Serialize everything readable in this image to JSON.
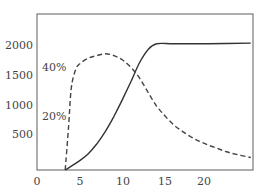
{
  "chart_data": {
    "type": "line",
    "title": "",
    "xlabel": "",
    "ylabel": "",
    "xlim": [
      0,
      25
    ],
    "ylim": [
      0,
      2300
    ],
    "grid": false,
    "x_ticks": [
      "0",
      "5",
      "10",
      "15",
      "20"
    ],
    "y_ticks": [
      "500",
      "1000",
      "1500",
      "2000"
    ],
    "annotations": [
      {
        "text": "40%",
        "note": "secondary scale label for dashed curve"
      },
      {
        "text": "20%",
        "note": "secondary scale label for dashed curve"
      }
    ],
    "series": [
      {
        "name": "solid",
        "style": "solid",
        "x": [
          3.3,
          5,
          6,
          7,
          8,
          9,
          10,
          11,
          12,
          13,
          14,
          16,
          20,
          25
        ],
        "values": [
          0,
          150,
          260,
          420,
          620,
          860,
          1130,
          1420,
          1720,
          1930,
          2020,
          2020,
          2020,
          2030
        ]
      },
      {
        "name": "dashed",
        "style": "dashed",
        "x": [
          3.3,
          3.7,
          4.0,
          4.5,
          5,
          6,
          7,
          8,
          9,
          10,
          11,
          12,
          13,
          14,
          15,
          16,
          17,
          18,
          19,
          20,
          21,
          22,
          23,
          25
        ],
        "values": [
          0,
          700,
          1300,
          1600,
          1700,
          1790,
          1830,
          1860,
          1830,
          1760,
          1640,
          1470,
          1240,
          1020,
          860,
          720,
          620,
          530,
          460,
          400,
          350,
          300,
          260,
          200
        ]
      }
    ]
  },
  "labels": {
    "y": [
      "2000",
      "1500",
      "1000",
      "500"
    ],
    "x": [
      "0",
      "5",
      "10",
      "15",
      "20"
    ],
    "ann40": "40%",
    "ann20": "20%"
  }
}
